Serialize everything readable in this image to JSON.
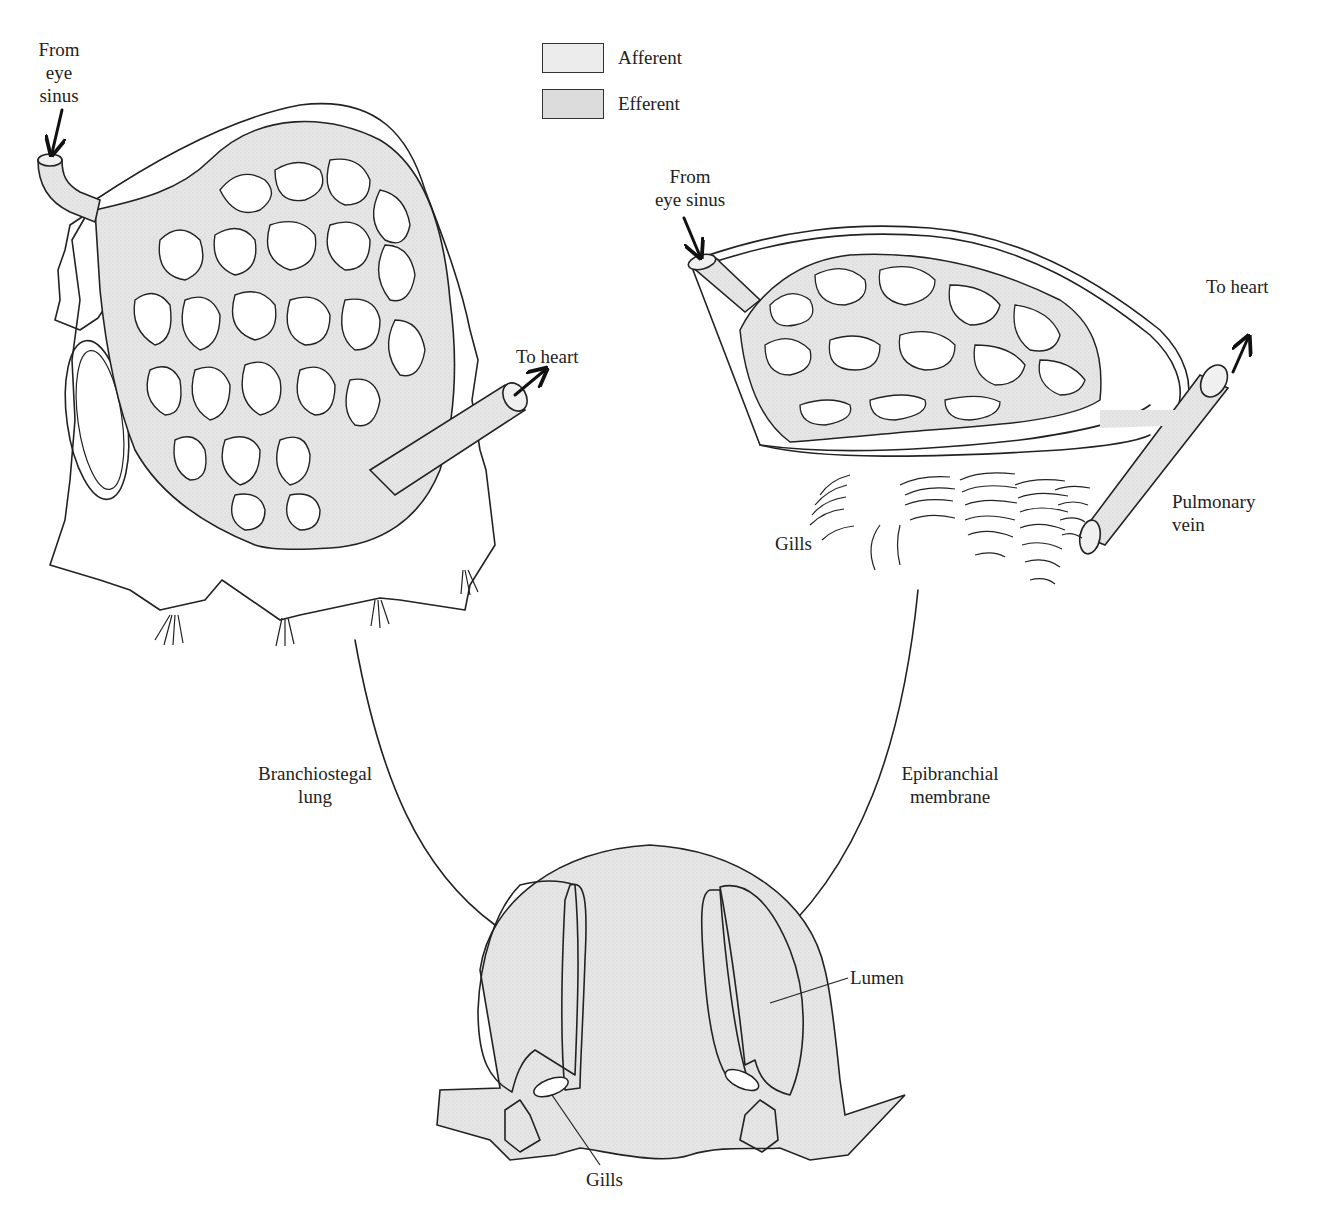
{
  "figure": {
    "colors": {
      "afferent": "#ececec",
      "efferent": "#dedede",
      "tissue": "#e4e4e4",
      "line": "#222222",
      "background": "#ffffff"
    },
    "legend": [
      {
        "label": "Afferent",
        "swatch": "afferent"
      },
      {
        "label": "Efferent",
        "swatch": "efferent"
      }
    ],
    "panels": {
      "left_lung": {
        "label_from": "From\neye\nsinus",
        "label_from_lines": [
          "From",
          "eye",
          "sinus"
        ],
        "label_to": "To heart"
      },
      "right_membrane": {
        "label_from_lines": [
          "From",
          "eye sinus"
        ],
        "label_to": "To heart",
        "label_vein_lines": [
          "Pulmonary",
          "vein"
        ],
        "label_gills": "Gills"
      },
      "cross_section": {
        "label_branchiostegal_lines": [
          "Branchiostegal",
          "lung"
        ],
        "label_epibranchial_lines": [
          "Epibranchial",
          "membrane"
        ],
        "label_lumen": "Lumen",
        "label_gills": "Gills"
      }
    }
  }
}
